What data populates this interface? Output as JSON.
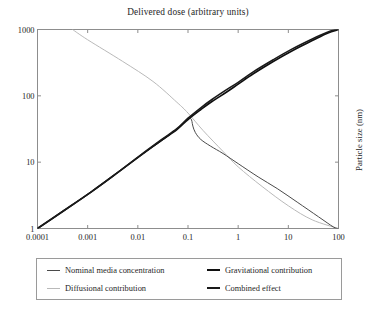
{
  "chart_data": {
    "type": "line",
    "title": "Delivered dose (arbitrary units)",
    "xlabel": "Delivered dose (arbitrary units)",
    "ylabel": "Particle size  (nm)",
    "xscale": "log",
    "yscale": "log",
    "xlim": [
      0.0001,
      100
    ],
    "ylim": [
      1,
      1000
    ],
    "grid": false,
    "legend_position": "below-axes",
    "xticks": [
      "0.0001",
      "0.001",
      "0.01",
      "0.1",
      "1",
      "10",
      "100"
    ],
    "xtick_values": [
      0.0001,
      0.001,
      0.01,
      0.1,
      1,
      10,
      100
    ],
    "yticks": [
      "1",
      "10",
      "100",
      "1000"
    ],
    "ytick_values": [
      1,
      10,
      100,
      1000
    ],
    "series": [
      {
        "name": "Nominal media concentration",
        "color": "#4a4a4a",
        "width": 1.0,
        "points": [
          [
            0.0001,
            1
          ],
          [
            0.00035,
            1.9
          ],
          [
            0.0012,
            3.6
          ],
          [
            0.004,
            7.0
          ],
          [
            0.012,
            13.0
          ],
          [
            0.03,
            21.0
          ],
          [
            0.055,
            30.0
          ],
          [
            0.08,
            38.0
          ],
          [
            0.098,
            44.0
          ],
          [
            0.108,
            46.0
          ],
          [
            0.115,
            45.0
          ],
          [
            0.12,
            41.0
          ],
          [
            0.125,
            35.0
          ],
          [
            0.14,
            28.0
          ],
          [
            0.18,
            22.0
          ],
          [
            0.28,
            17.5
          ],
          [
            0.5,
            13.5
          ],
          [
            1,
            9.5
          ],
          [
            2.5,
            6.0
          ],
          [
            6,
            4.0
          ],
          [
            15,
            2.5
          ],
          [
            40,
            1.5
          ],
          [
            80,
            1.05
          ],
          [
            100,
            1
          ]
        ]
      },
      {
        "name": "Diffusional contribution",
        "color": "#b9b9b9",
        "width": 1.0,
        "points": [
          [
            0.0005,
            1000
          ],
          [
            0.001,
            700
          ],
          [
            0.005,
            330
          ],
          [
            0.02,
            165
          ],
          [
            0.06,
            80
          ],
          [
            0.1,
            55
          ],
          [
            0.2,
            30
          ],
          [
            0.5,
            14.5
          ],
          [
            1,
            8.5
          ],
          [
            3,
            4.3
          ],
          [
            10,
            2.2
          ],
          [
            30,
            1.35
          ],
          [
            100,
            1
          ]
        ]
      },
      {
        "name": "Gravitational contribution",
        "color": "#101010",
        "width": 1.7,
        "points": [
          [
            0.0001,
            1
          ],
          [
            0.00035,
            1.9
          ],
          [
            0.0012,
            3.6
          ],
          [
            0.004,
            7.0
          ],
          [
            0.012,
            13.0
          ],
          [
            0.03,
            21.5
          ],
          [
            0.06,
            31.0
          ],
          [
            0.1,
            44.0
          ],
          [
            0.18,
            62.0
          ],
          [
            0.3,
            82.0
          ],
          [
            0.6,
            115.0
          ],
          [
            1,
            150.0
          ],
          [
            2,
            215.0
          ],
          [
            5,
            330.0
          ],
          [
            12,
            480.0
          ],
          [
            30,
            680.0
          ],
          [
            60,
            880.0
          ],
          [
            100,
            1000
          ]
        ]
      },
      {
        "name": "Combined effect",
        "color": "#1a1a1a",
        "width": 1.6,
        "points": [
          [
            0.0001,
            1
          ],
          [
            0.00035,
            1.9
          ],
          [
            0.0012,
            3.6
          ],
          [
            0.004,
            7.0
          ],
          [
            0.012,
            13.2
          ],
          [
            0.03,
            22.0
          ],
          [
            0.06,
            32.0
          ],
          [
            0.1,
            46.0
          ],
          [
            0.18,
            66.0
          ],
          [
            0.3,
            88.0
          ],
          [
            0.6,
            125.0
          ],
          [
            1,
            160.0
          ],
          [
            2,
            230.0
          ],
          [
            5,
            350.0
          ],
          [
            12,
            510.0
          ],
          [
            30,
            720.0
          ],
          [
            60,
            910.0
          ],
          [
            100,
            1030
          ]
        ]
      }
    ]
  },
  "legend": {
    "entries": [
      {
        "label": "Nominal media concentration",
        "color": "#4a4a4a",
        "width": 1
      },
      {
        "label": "Gravitational contribution",
        "color": "#101010",
        "width": 2
      },
      {
        "label": "Diffusional contribution",
        "color": "#b9b9b9",
        "width": 1
      },
      {
        "label": "Combined effect",
        "color": "#1a1a1a",
        "width": 2
      }
    ]
  },
  "axes": {
    "frame_color": "#8d8d8d",
    "tick_color": "#8d8d8d"
  }
}
